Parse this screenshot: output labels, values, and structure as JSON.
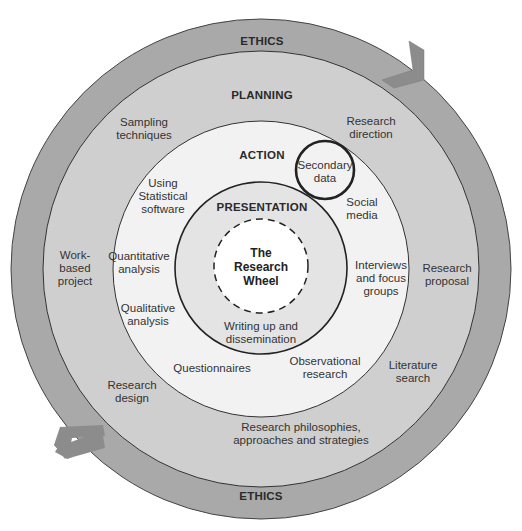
{
  "diagram": {
    "title": "The Research Wheel",
    "center_label": [
      "The",
      "Research",
      "Wheel"
    ],
    "colors": {
      "ethics_ring": "#a9a9a9",
      "planning_ring": "#cfcfcf",
      "action_ring": "#f2f2f2",
      "presentation_ring": "#e4e4e4",
      "center": "#ffffff",
      "arrow": "#8c8c8c",
      "stroke": "#333333"
    },
    "rings": {
      "ethics": {
        "heading_top": "ETHICS",
        "heading_bottom": "ETHICS"
      },
      "planning": {
        "heading": "PLANNING",
        "items": [
          [
            "Sampling",
            "techniques"
          ],
          [
            "Research",
            "direction"
          ],
          [
            "Work-",
            "based",
            "project"
          ],
          [
            "Research",
            "proposal"
          ],
          [
            "Research",
            "design"
          ],
          [
            "Literature",
            "search"
          ],
          [
            "Research philosophies,",
            "approaches and strategies"
          ]
        ]
      },
      "action": {
        "heading": "ACTION",
        "items": [
          [
            "Secondary",
            "data"
          ],
          [
            "Using",
            "Statistical",
            "software"
          ],
          [
            "Social",
            "media"
          ],
          [
            "Quantitative",
            "analysis"
          ],
          [
            "Interviews",
            "and focus",
            "groups"
          ],
          [
            "Qualitative",
            "analysis"
          ],
          [
            "Questionnaires"
          ],
          [
            "Observational",
            "research"
          ]
        ]
      },
      "presentation": {
        "heading": "PRESENTATION",
        "items": [
          [
            "Writing up and",
            "dissemination"
          ]
        ]
      }
    },
    "highlight": "Secondary data"
  }
}
